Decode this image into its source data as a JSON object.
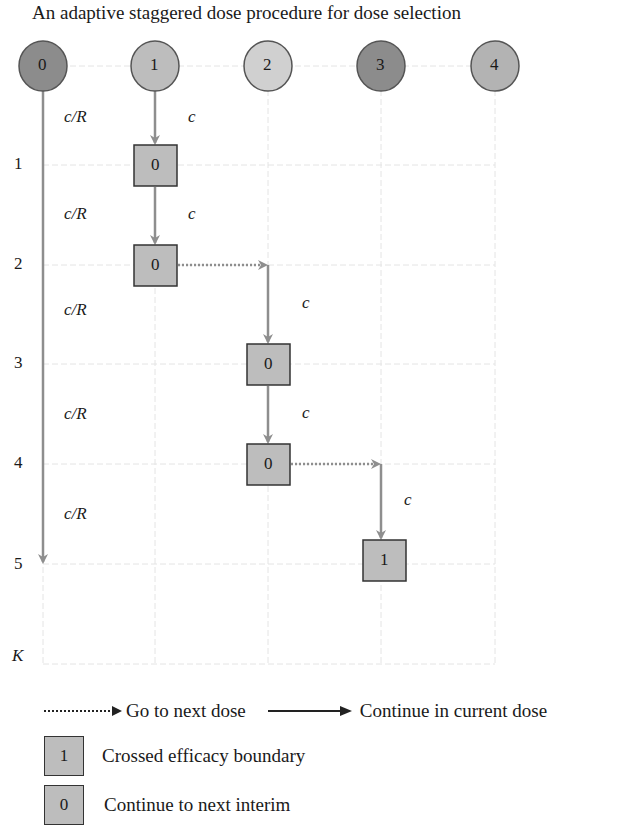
{
  "title": "An adaptive staggered dose procedure for dose selection",
  "doses": [
    {
      "label": "0",
      "x": 43,
      "color": "#8c8c8c"
    },
    {
      "label": "1",
      "x": 155,
      "color": "#bdbdbd"
    },
    {
      "label": "2",
      "x": 268,
      "color": "#d0d0d0"
    },
    {
      "label": "3",
      "x": 381,
      "color": "#8c8c8c"
    },
    {
      "label": "4",
      "x": 495,
      "color": "#b3b3b3"
    }
  ],
  "rows": [
    {
      "label": "1",
      "y": 165
    },
    {
      "label": "2",
      "y": 265
    },
    {
      "label": "3",
      "y": 364
    },
    {
      "label": "4",
      "y": 464
    },
    {
      "label": "5",
      "y": 564
    },
    {
      "label": "K",
      "y": 664
    }
  ],
  "control_arm_labels": [
    "c/R",
    "c/R",
    "c/R",
    "c/R",
    "c/R"
  ],
  "path_label": "c",
  "boxes": [
    {
      "dose": 1,
      "interim": 1,
      "value": "0"
    },
    {
      "dose": 1,
      "interim": 2,
      "value": "0"
    },
    {
      "dose": 2,
      "interim": 3,
      "value": "0"
    },
    {
      "dose": 2,
      "interim": 4,
      "value": "0"
    },
    {
      "dose": 3,
      "interim": 5,
      "value": "1"
    }
  ],
  "legend": {
    "dotted_arrow": "Go to next dose",
    "solid_arrow": "Continue in current dose",
    "box_1_value": "1",
    "box_1_label": "Crossed efficacy boundary",
    "box_0_value": "0",
    "box_0_label": "Continue to next interim"
  },
  "colors": {
    "arrow": "#8e8e8e",
    "grid": "#e4e4e4",
    "box_fill": "#bdbdbd",
    "box_border": "#333333"
  }
}
